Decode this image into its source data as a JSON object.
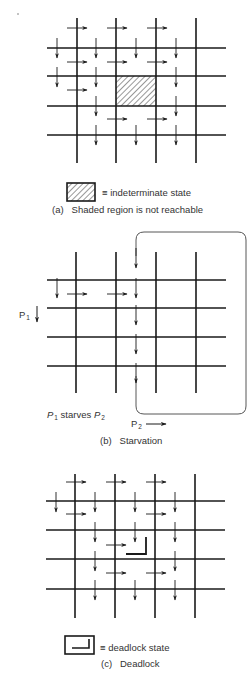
{
  "colors": {
    "ink": "#1a1a1a",
    "text": "#333333",
    "background": "#ffffff"
  },
  "panels": [
    {
      "id": "a",
      "grid": {
        "xs": [
          77,
          116,
          156,
          196
        ],
        "ys": [
          48,
          76,
          106,
          135
        ],
        "hx": [
          47,
          226
        ],
        "vy": [
          18,
          163
        ]
      },
      "hatched_cell": {
        "x": 116,
        "y": 76,
        "w": 40,
        "h": 30
      },
      "right_arrows": [
        [
          67,
          28
        ],
        [
          107,
          28
        ],
        [
          147,
          28
        ],
        [
          67,
          62
        ],
        [
          107,
          62
        ],
        [
          147,
          62
        ],
        [
          67,
          90
        ],
        [
          107,
          119
        ],
        [
          147,
          119
        ]
      ],
      "down_arrows": [
        [
          57,
          38
        ],
        [
          96,
          38
        ],
        [
          136,
          38
        ],
        [
          176,
          38
        ],
        [
          57,
          67
        ],
        [
          96,
          67
        ],
        [
          176,
          67
        ],
        [
          96,
          96
        ],
        [
          176,
          96
        ],
        [
          96,
          125
        ],
        [
          136,
          125
        ],
        [
          176,
          125
        ]
      ],
      "legend": {
        "symbol": "hatched-box",
        "text": "≡ indeterminate state"
      },
      "caption": {
        "tag": "(a)",
        "text": "Shaded region is not reachable"
      }
    },
    {
      "id": "b",
      "grid": {
        "xs": [
          76,
          116,
          156,
          196
        ],
        "ys": [
          280,
          308,
          337,
          366
        ],
        "hx": [
          47,
          226
        ],
        "vy": [
          252,
          393
        ]
      },
      "loop": {
        "x1": 136,
        "x2": 246,
        "top": 232,
        "bottom": 414
      },
      "right_arrows": [
        [
          67,
          294
        ],
        [
          107,
          294
        ]
      ],
      "down_arrows": [
        [
          57,
          278
        ],
        [
          136,
          248
        ],
        [
          136,
          278
        ],
        [
          136,
          305
        ],
        [
          136,
          334
        ],
        [
          136,
          363
        ]
      ],
      "labels": {
        "p1": "P",
        "p1_sub": "1",
        "starves_p": "P",
        "starves_sub1": "1",
        "starves_text": "starves",
        "starves_p2": "P",
        "starves_sub2": "2",
        "p2": "P",
        "p2_sub": "2"
      },
      "caption": {
        "tag": "(b)",
        "text": "Starvation"
      }
    },
    {
      "id": "c",
      "grid": {
        "xs": [
          75,
          115,
          155,
          195
        ],
        "ys": [
          501,
          530,
          559,
          589
        ],
        "hx": [
          46,
          225
        ],
        "vy": [
          474,
          618
        ]
      },
      "deadlock_corner": {
        "x1": 126,
        "y1": 554,
        "x2": 146,
        "y2": 537
      },
      "right_arrows": [
        [
          66,
          482
        ],
        [
          106,
          482
        ],
        [
          146,
          482
        ],
        [
          66,
          514
        ],
        [
          146,
          514
        ],
        [
          106,
          545
        ],
        [
          106,
          573
        ],
        [
          146,
          573
        ]
      ],
      "down_arrows": [
        [
          56,
          492
        ],
        [
          95,
          492
        ],
        [
          135,
          492
        ],
        [
          175,
          492
        ],
        [
          95,
          522
        ],
        [
          135,
          522
        ],
        [
          175,
          522
        ],
        [
          95,
          551
        ],
        [
          175,
          551
        ],
        [
          95,
          580
        ],
        [
          135,
          580
        ],
        [
          175,
          580
        ]
      ],
      "legend": {
        "symbol": "deadlock-box",
        "text": "≡ deadlock state"
      },
      "caption": {
        "tag": "(c)",
        "text": "Deadlock"
      }
    }
  ]
}
